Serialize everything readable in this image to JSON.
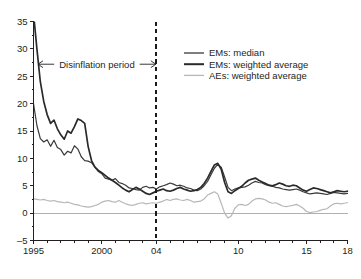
{
  "chart_data": {
    "type": "line",
    "title": "",
    "subtitle": "",
    "xlabel": "",
    "ylabel": "",
    "xlim": [
      1995,
      2018
    ],
    "ylim": [
      -5,
      36
    ],
    "yticks": [
      -5,
      0,
      5,
      10,
      15,
      20,
      25,
      30,
      35
    ],
    "ytick_labels": [
      "–5",
      "0",
      "5",
      "10",
      "15",
      "20",
      "25",
      "30",
      "35"
    ],
    "y_minor_step": 2.5,
    "xticks": [
      1995,
      2000,
      2004,
      2010,
      2015,
      2018
    ],
    "xtick_labels": [
      "1995",
      "2000",
      "04",
      "10",
      "15",
      "18"
    ],
    "x_minor_step": 1,
    "grid": false,
    "zero_line": 0,
    "legend_position": "top-right",
    "annotations": [
      {
        "name": "disinflation-period",
        "text": "Disinflation period",
        "x_start": 1995,
        "x_end": 2004,
        "y": 27.2,
        "style": "double-headed-arrow"
      },
      {
        "name": "period-end-marker",
        "text": "",
        "x": 2004,
        "style": "dashed-vertical-line"
      }
    ],
    "series": [
      {
        "name": "EMs: median",
        "color": "#3a3a3a",
        "width": 1.2,
        "x": [
          1995.0,
          1995.25,
          1995.5,
          1995.75,
          1996.0,
          1996.25,
          1996.5,
          1996.75,
          1997.0,
          1997.25,
          1997.5,
          1997.75,
          1998.0,
          1998.25,
          1998.5,
          1998.75,
          1999.0,
          1999.25,
          1999.5,
          1999.75,
          2000.0,
          2000.25,
          2000.5,
          2000.75,
          2001.0,
          2001.25,
          2001.5,
          2001.75,
          2002.0,
          2002.25,
          2002.5,
          2002.75,
          2003.0,
          2003.25,
          2003.5,
          2003.75,
          2004.0,
          2004.25,
          2004.5,
          2004.75,
          2005.0,
          2005.25,
          2005.5,
          2005.75,
          2006.0,
          2006.25,
          2006.5,
          2006.75,
          2007.0,
          2007.25,
          2007.5,
          2007.75,
          2008.0,
          2008.25,
          2008.5,
          2008.75,
          2009.0,
          2009.25,
          2009.5,
          2009.75,
          2010.0,
          2010.25,
          2010.5,
          2010.75,
          2011.0,
          2011.25,
          2011.5,
          2011.75,
          2012.0,
          2012.25,
          2012.5,
          2012.75,
          2013.0,
          2013.25,
          2013.5,
          2013.75,
          2014.0,
          2014.25,
          2014.5,
          2014.75,
          2015.0,
          2015.25,
          2015.5,
          2015.75,
          2016.0,
          2016.25,
          2016.5,
          2016.75,
          2017.0,
          2017.25,
          2017.5,
          2017.75,
          2018.0
        ],
        "y": [
          20.0,
          16.0,
          13.6,
          13.0,
          13.4,
          12.2,
          13.3,
          12.0,
          11.6,
          10.6,
          11.3,
          11.0,
          12.3,
          11.7,
          10.3,
          9.6,
          9.5,
          9.2,
          8.4,
          7.6,
          7.2,
          6.4,
          6.2,
          6.0,
          6.3,
          5.6,
          5.4,
          5.1,
          4.6,
          4.5,
          4.3,
          4.2,
          4.7,
          4.9,
          4.6,
          4.7,
          4.4,
          4.8,
          5.0,
          5.2,
          5.5,
          5.3,
          5.0,
          5.1,
          4.9,
          4.6,
          4.5,
          4.2,
          4.1,
          4.4,
          5.0,
          5.8,
          7.0,
          8.2,
          8.9,
          8.4,
          6.6,
          4.7,
          4.1,
          4.4,
          4.6,
          4.7,
          4.8,
          5.1,
          5.5,
          5.8,
          5.6,
          5.5,
          5.2,
          5.0,
          4.9,
          4.7,
          4.6,
          4.4,
          4.3,
          4.2,
          4.3,
          4.4,
          4.2,
          3.9,
          3.7,
          3.5,
          3.6,
          3.7,
          3.6,
          3.5,
          3.4,
          3.6,
          3.8,
          3.7,
          3.6,
          3.5,
          3.6
        ]
      },
      {
        "name": "EMs: weighted average",
        "color": "#2a2a2a",
        "width": 1.7,
        "x": [
          1995.0,
          1995.25,
          1995.5,
          1995.75,
          1996.0,
          1996.25,
          1996.5,
          1996.75,
          1997.0,
          1997.25,
          1997.5,
          1997.75,
          1998.0,
          1998.25,
          1998.5,
          1998.75,
          1999.0,
          1999.25,
          1999.5,
          1999.75,
          2000.0,
          2000.25,
          2000.5,
          2000.75,
          2001.0,
          2001.25,
          2001.5,
          2001.75,
          2002.0,
          2002.25,
          2002.5,
          2002.75,
          2003.0,
          2003.25,
          2003.5,
          2003.75,
          2004.0,
          2004.25,
          2004.5,
          2004.75,
          2005.0,
          2005.25,
          2005.5,
          2005.75,
          2006.0,
          2006.25,
          2006.5,
          2006.75,
          2007.0,
          2007.25,
          2007.5,
          2007.75,
          2008.0,
          2008.25,
          2008.5,
          2008.75,
          2009.0,
          2009.25,
          2009.5,
          2009.75,
          2010.0,
          2010.25,
          2010.5,
          2010.75,
          2011.0,
          2011.25,
          2011.5,
          2011.75,
          2012.0,
          2012.25,
          2012.5,
          2012.75,
          2013.0,
          2013.25,
          2013.5,
          2013.75,
          2014.0,
          2014.25,
          2014.5,
          2014.75,
          2015.0,
          2015.25,
          2015.5,
          2015.75,
          2016.0,
          2016.25,
          2016.5,
          2016.75,
          2017.0,
          2017.25,
          2017.5,
          2017.75,
          2018.0
        ],
        "y": [
          36.5,
          30.0,
          24.0,
          20.4,
          18.0,
          16.4,
          17.0,
          15.4,
          14.3,
          13.5,
          15.0,
          14.6,
          15.8,
          17.2,
          16.9,
          16.4,
          12.2,
          9.6,
          8.4,
          7.8,
          7.4,
          6.9,
          6.4,
          6.0,
          5.6,
          5.1,
          4.6,
          4.2,
          3.9,
          4.3,
          4.7,
          4.4,
          4.0,
          3.6,
          3.4,
          3.7,
          4.0,
          4.2,
          4.4,
          4.1,
          4.0,
          4.2,
          4.5,
          4.7,
          4.4,
          4.2,
          4.0,
          4.1,
          4.3,
          4.7,
          5.4,
          6.4,
          7.6,
          8.8,
          9.1,
          8.0,
          5.6,
          3.9,
          3.6,
          4.1,
          4.5,
          4.9,
          5.5,
          6.0,
          6.2,
          6.4,
          6.0,
          5.7,
          5.4,
          5.1,
          5.0,
          5.2,
          5.5,
          5.3,
          5.0,
          4.9,
          5.1,
          5.0,
          4.6,
          4.2,
          4.0,
          4.3,
          4.6,
          4.5,
          4.3,
          4.1,
          3.9,
          3.7,
          3.9,
          4.1,
          4.0,
          3.9,
          4.0
        ]
      },
      {
        "name": "AEs: weighted average",
        "color": "#b7b7b7",
        "width": 1.2,
        "x": [
          1995.0,
          1995.25,
          1995.5,
          1995.75,
          1996.0,
          1996.25,
          1996.5,
          1996.75,
          1997.0,
          1997.25,
          1997.5,
          1997.75,
          1998.0,
          1998.25,
          1998.5,
          1998.75,
          1999.0,
          1999.25,
          1999.5,
          1999.75,
          2000.0,
          2000.25,
          2000.5,
          2000.75,
          2001.0,
          2001.25,
          2001.5,
          2001.75,
          2002.0,
          2002.25,
          2002.5,
          2002.75,
          2003.0,
          2003.25,
          2003.5,
          2003.75,
          2004.0,
          2004.25,
          2004.5,
          2004.75,
          2005.0,
          2005.25,
          2005.5,
          2005.75,
          2006.0,
          2006.25,
          2006.5,
          2006.75,
          2007.0,
          2007.25,
          2007.5,
          2007.75,
          2008.0,
          2008.25,
          2008.5,
          2008.75,
          2009.0,
          2009.25,
          2009.5,
          2009.75,
          2010.0,
          2010.25,
          2010.5,
          2010.75,
          2011.0,
          2011.25,
          2011.5,
          2011.75,
          2012.0,
          2012.25,
          2012.5,
          2012.75,
          2013.0,
          2013.25,
          2013.5,
          2013.75,
          2014.0,
          2014.25,
          2014.5,
          2014.75,
          2015.0,
          2015.25,
          2015.5,
          2015.75,
          2016.0,
          2016.25,
          2016.5,
          2016.75,
          2017.0,
          2017.25,
          2017.5,
          2017.75,
          2018.0
        ],
        "y": [
          2.6,
          2.5,
          2.4,
          2.5,
          2.3,
          2.2,
          2.3,
          2.1,
          2.0,
          1.9,
          2.0,
          1.8,
          1.6,
          1.5,
          1.3,
          1.2,
          1.1,
          1.2,
          1.4,
          1.6,
          2.0,
          2.2,
          2.3,
          2.1,
          2.0,
          2.3,
          2.0,
          1.7,
          1.5,
          1.4,
          1.6,
          1.8,
          1.9,
          1.7,
          1.8,
          1.9,
          1.8,
          2.0,
          2.2,
          2.5,
          2.3,
          2.5,
          2.6,
          2.4,
          2.3,
          2.5,
          2.3,
          2.0,
          2.1,
          2.2,
          2.6,
          3.3,
          3.6,
          3.9,
          3.5,
          1.8,
          0.0,
          -0.9,
          -0.5,
          0.9,
          1.5,
          1.6,
          1.4,
          1.6,
          2.2,
          2.6,
          2.7,
          2.6,
          2.4,
          2.0,
          1.8,
          1.9,
          1.6,
          1.3,
          1.2,
          1.3,
          1.4,
          1.6,
          1.3,
          0.9,
          0.3,
          0.1,
          0.2,
          0.3,
          0.5,
          0.7,
          0.8,
          1.3,
          1.7,
          1.8,
          1.7,
          1.8,
          1.9
        ]
      }
    ]
  },
  "legend": {
    "items": [
      {
        "label": "EMs: median",
        "color": "#3a3a3a",
        "width": 1.3
      },
      {
        "label": "EMs: weighted average",
        "color": "#2a2a2a",
        "width": 2.0
      },
      {
        "label": "AEs: weighted average",
        "color": "#b7b7b7",
        "width": 1.3
      }
    ]
  },
  "axes": {
    "y_tick_labels": [
      "35",
      "30",
      "25",
      "20",
      "15",
      "10",
      "5",
      "0",
      "–5"
    ],
    "x_tick_labels": [
      "1995",
      "2000",
      "04",
      "10",
      "15",
      "18"
    ]
  },
  "annotation_text": {
    "disinflation": "Disinflation period"
  },
  "colors": {
    "axis": "#231f20",
    "zero_line": "#b0b0b0",
    "dashed_marker": "#1a1a1a",
    "ems_median": "#3a3a3a",
    "ems_weighted": "#2a2a2a",
    "aes_weighted": "#b7b7b7",
    "background": "#ffffff"
  }
}
